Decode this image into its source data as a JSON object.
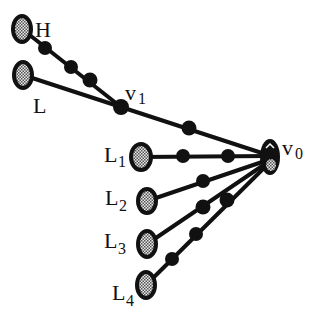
{
  "diagram": {
    "type": "graph",
    "nodes": {
      "H": {
        "label": "H",
        "x": 22,
        "y": 29,
        "rx": 10,
        "ry": 14
      },
      "L": {
        "label": "L",
        "x": 23,
        "y": 75,
        "rx": 10,
        "ry": 14
      },
      "v1": {
        "label": "v",
        "sub": "1",
        "x": 121,
        "y": 107
      },
      "v0": {
        "label": "v",
        "sub": "0",
        "x": 270,
        "y": 157,
        "rx": 10,
        "ry": 18
      },
      "L1": {
        "label": "L",
        "sub": "1",
        "x": 141,
        "y": 157,
        "rx": 11,
        "ry": 14
      },
      "L2": {
        "label": "L",
        "sub": "2",
        "x": 147,
        "y": 201,
        "rx": 10,
        "ry": 13
      },
      "L3": {
        "label": "L",
        "sub": "3",
        "x": 147,
        "y": 244,
        "rx": 10,
        "ry": 14
      },
      "L4": {
        "label": "L",
        "sub": "4",
        "x": 146,
        "y": 285,
        "rx": 10,
        "ry": 14
      }
    },
    "edges": [
      {
        "from": "H",
        "to": "v1",
        "intermediate_dots": 3
      },
      {
        "from": "L",
        "to": "v1",
        "intermediate_dots": 0
      },
      {
        "from": "v1",
        "to": "v0",
        "intermediate_dots": 1
      },
      {
        "from": "L1",
        "to": "v0",
        "intermediate_dots": 2
      },
      {
        "from": "L2",
        "to": "v0",
        "intermediate_dots": 1
      },
      {
        "from": "L3",
        "to": "v0",
        "intermediate_dots": 1
      },
      {
        "from": "L4",
        "to": "v0",
        "intermediate_dots": 3
      }
    ],
    "colors": {
      "line": "#111111",
      "node_fill": "#b0b0b0",
      "dot": "#111111",
      "background": "#ffffff"
    }
  },
  "labels": {
    "H": "H",
    "L": "L",
    "v1_main": "v",
    "v1_sub": "1",
    "v0_main": "v",
    "v0_sub": "0",
    "L1_main": "L",
    "L1_sub": "1",
    "L2_main": "L",
    "L2_sub": "2",
    "L3_main": "L",
    "L3_sub": "3",
    "L4_main": "L",
    "L4_sub": "4"
  }
}
